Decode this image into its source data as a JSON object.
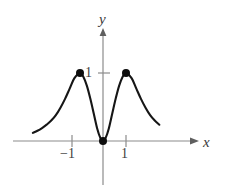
{
  "figure": {
    "background_color": "#ffffff",
    "width": 231,
    "height": 191
  },
  "axes": {
    "x_axis_label": "x",
    "y_axis_label": "y",
    "axis_color": "#8c8c8c",
    "label_color": "#3a3a3a",
    "x_axis_y_pixel": 141,
    "y_axis_x_pixel": 103,
    "x_ticks": [
      {
        "label": "−1",
        "value": -1
      },
      {
        "label": "1",
        "value": 1
      }
    ],
    "y_ticks": [
      {
        "label": "1",
        "value": 1
      }
    ]
  },
  "curve": {
    "color": "#161616",
    "stroke_width": 2.1,
    "marked_points": [
      {
        "label": "",
        "x": -1,
        "y": 1
      },
      {
        "label": "",
        "x": 0,
        "y": 0
      },
      {
        "label": "",
        "x": 1,
        "y": 1
      }
    ],
    "point_color": "#0d0d0d",
    "point_radius": 4
  },
  "chart_data": {
    "type": "line",
    "title": "",
    "subtitle": "",
    "xlabel": "x",
    "ylabel": "y",
    "xlim": [
      -3.1,
      2.6
    ],
    "ylim": [
      -0.28,
      1.55
    ],
    "grid": false,
    "legend": null,
    "xticks": [
      -1,
      1
    ],
    "xticklabels": [
      "−1",
      "1"
    ],
    "yticks": [
      1
    ],
    "yticklabels": [
      "1"
    ],
    "annotations": [
      {
        "text": "local maximum at x = −1, y = 1",
        "x": -1,
        "y": 1
      },
      {
        "text": "local minimum at origin, y = 0",
        "x": 0,
        "y": 0
      },
      {
        "text": "local maximum at x = 1, y = 1",
        "x": 1,
        "y": 1
      }
    ],
    "series": [
      {
        "name": "y = f(x)",
        "x": [
          -3.05,
          -2.85,
          -2.65,
          -2.45,
          -2.25,
          -2.05,
          -1.85,
          -1.65,
          -1.45,
          -1.25,
          -1.0,
          -0.85,
          -0.7,
          -0.55,
          -0.4,
          -0.25,
          -0.12,
          0.0,
          0.12,
          0.25,
          0.4,
          0.55,
          0.7,
          0.85,
          1.0,
          1.25,
          1.45,
          1.65,
          1.85,
          2.05,
          2.25,
          2.45
        ],
        "y": [
          0.12,
          0.15,
          0.19,
          0.24,
          0.3,
          0.38,
          0.49,
          0.62,
          0.77,
          0.92,
          1.0,
          0.94,
          0.81,
          0.62,
          0.4,
          0.18,
          0.05,
          0.0,
          0.05,
          0.18,
          0.4,
          0.62,
          0.81,
          0.94,
          1.0,
          0.92,
          0.77,
          0.62,
          0.49,
          0.38,
          0.3,
          0.24
        ]
      }
    ]
  }
}
